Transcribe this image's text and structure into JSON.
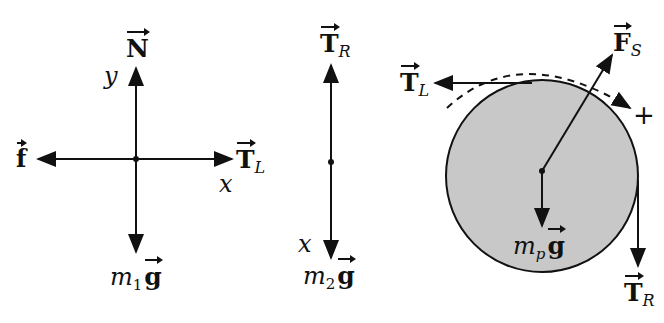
{
  "colors": {
    "ink": "#111111",
    "pulley_fill": "#c8c8c8",
    "background": "#ffffff"
  },
  "diagram_block": {
    "up_label": {
      "symbol": "N"
    },
    "left_label": {
      "symbol": "f"
    },
    "right_label": {
      "symbol": "T",
      "subscript": "L"
    },
    "down_label": {
      "mass": "m",
      "mass_subscript": "1",
      "symbol": "g"
    },
    "axis_y": "y",
    "axis_x": "x"
  },
  "diagram_hanging_mass": {
    "up_label": {
      "symbol": "T",
      "subscript": "R"
    },
    "down_label": {
      "mass": "m",
      "mass_subscript": "2",
      "symbol": "g"
    },
    "axis_x": "x"
  },
  "diagram_pulley": {
    "left_tension": {
      "symbol": "T",
      "subscript": "L"
    },
    "support_force": {
      "symbol": "F",
      "subscript": "S"
    },
    "right_tension": {
      "symbol": "T",
      "subscript": "R"
    },
    "weight": {
      "mass": "m",
      "mass_subscript": "p",
      "symbol": "g"
    },
    "rotation_sign": "+"
  }
}
